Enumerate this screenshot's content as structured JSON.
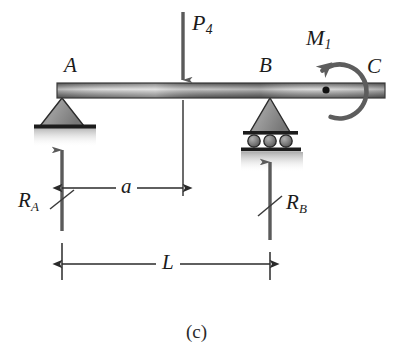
{
  "figure": {
    "caption": "(c)",
    "type": "free-body-diagram"
  },
  "labels": {
    "point_a": "A",
    "point_b": "B",
    "point_c": "C",
    "load_p": "P",
    "load_p_sub": "4",
    "moment_m": "M",
    "moment_m_sub": "1",
    "reaction_a": "R",
    "reaction_a_sub": "A",
    "reaction_b": "R",
    "reaction_b_sub": "B",
    "dim_a": "a",
    "dim_l": "L"
  },
  "colors": {
    "ink": "#1b1b1b",
    "beam_dark": "#6e6e6e",
    "beam_mid": "#8d8d8d",
    "beam_light": "#d8d8d8",
    "beam_edge": "#3a3a3a",
    "support_fill": "#8a8a8a",
    "support_edge": "#2b2b2b",
    "arrow": "#5a5a5a",
    "dim_line": "#2a2a2a",
    "shadow": "#bdbdbd",
    "background": "#ffffff"
  },
  "geometry": {
    "beam": {
      "x1": 57,
      "x2": 385,
      "y_top": 83,
      "y_bottom": 98
    },
    "support_a_x": 62,
    "support_b_x": 270,
    "load_p_x": 183,
    "moment_center_x": 345,
    "moment_center_y": 91,
    "moment_dot_x": 326,
    "moment_dot_y": 90,
    "dim_a_y": 188,
    "dim_l_y": 264
  },
  "elements": {
    "beam_name": "beam",
    "pin_support_name": "pin-support-a",
    "roller_support_name": "roller-support-b",
    "rollers_count": 3
  }
}
